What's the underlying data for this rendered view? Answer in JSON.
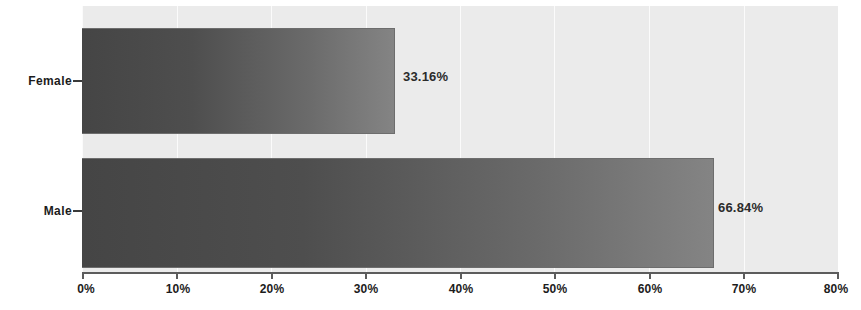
{
  "chart_data": {
    "type": "bar",
    "orientation": "horizontal",
    "title": "",
    "xlabel": "",
    "ylabel": "",
    "categories": [
      "Female",
      "Male"
    ],
    "values": [
      33.16,
      66.84
    ],
    "value_labels": [
      "33.16%",
      "66.84%"
    ],
    "xlim": [
      0,
      80
    ],
    "xticks": [
      0,
      10,
      20,
      30,
      40,
      50,
      60,
      70,
      80
    ],
    "xtick_labels": [
      "0%",
      "10%",
      "20%",
      "30%",
      "40%",
      "50%",
      "60%",
      "70%",
      "80%"
    ],
    "grid": true,
    "legend": false,
    "series": [
      {
        "name": "",
        "values": [
          33.16,
          66.84
        ]
      }
    ],
    "colors": {
      "bar_start": "#454545",
      "bar_end": "#848484",
      "bar_border": "#6d6d6d",
      "plot_background": "#ebebeb",
      "gridline": "#fbfbfb",
      "axis_line": "#5c5c5c",
      "text": "#1c1c1c",
      "figure_background": "#ffffff"
    }
  },
  "axis": {
    "x_ticks": [
      {
        "value": 0,
        "label": "0%"
      },
      {
        "value": 10,
        "label": "10%"
      },
      {
        "value": 20,
        "label": "20%"
      },
      {
        "value": 30,
        "label": "30%"
      },
      {
        "value": 40,
        "label": "40%"
      },
      {
        "value": 50,
        "label": "50%"
      },
      {
        "value": 60,
        "label": "60%"
      },
      {
        "value": 70,
        "label": "70%"
      },
      {
        "value": 80,
        "label": "80%"
      }
    ],
    "categories": [
      {
        "label": "Female"
      },
      {
        "label": "Male"
      }
    ]
  },
  "bars": [
    {
      "category": "Female",
      "value": 33.16,
      "label": "33.16%"
    },
    {
      "category": "Male",
      "value": 66.84,
      "label": "66.84%"
    }
  ]
}
